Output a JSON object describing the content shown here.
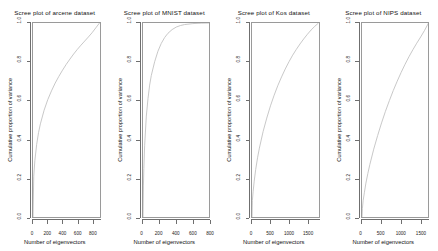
{
  "figure": {
    "background": "#ffffff",
    "curve_color": "#c2c2c2",
    "axis_color": "#6f6f6f",
    "box_color": "#9a9a9a"
  },
  "chart_data": [
    {
      "type": "line",
      "title": "Scree plot of arcene dataset",
      "xlabel": "Number of eigenvectors",
      "ylabel": "Cumulative proportion of variance",
      "xlim": [
        0,
        900
      ],
      "ylim": [
        0,
        1.0
      ],
      "xticks": [
        0,
        200,
        400,
        600,
        800
      ],
      "xticklabels": [
        "0",
        "200",
        "400",
        "600",
        "800"
      ],
      "yticks": [
        0.0,
        0.2,
        0.4,
        0.6,
        0.8,
        1.0
      ],
      "yticklabels": [
        "0.0",
        "0.2",
        "0.4",
        "0.6",
        "0.8",
        "1.0"
      ],
      "grid": false,
      "legend": "none",
      "series": [
        {
          "name": "cumulative proportion of variance",
          "x": [
            0,
            10,
            25,
            50,
            75,
            100,
            150,
            200,
            250,
            300,
            350,
            400,
            450,
            500,
            550,
            600,
            650,
            700,
            750,
            800,
            850,
            900
          ],
          "y": [
            0.0,
            0.21,
            0.29,
            0.375,
            0.435,
            0.48,
            0.55,
            0.605,
            0.65,
            0.69,
            0.725,
            0.757,
            0.787,
            0.814,
            0.84,
            0.864,
            0.886,
            0.907,
            0.928,
            0.95,
            0.975,
            1.0
          ]
        }
      ]
    },
    {
      "type": "line",
      "title": "Scree plot of MNIST dataset",
      "xlabel": "Number of eigenvectors",
      "ylabel": "Cumulative proportion of variance",
      "xlim": [
        0,
        800
      ],
      "ylim": [
        0,
        1.0
      ],
      "xticks": [
        0,
        200,
        400,
        600,
        800
      ],
      "xticklabels": [
        "0",
        "200",
        "400",
        "600",
        "800"
      ],
      "yticks": [
        0.0,
        0.2,
        0.4,
        0.6,
        0.8,
        1.0
      ],
      "yticklabels": [
        "0.0",
        "0.2",
        "0.4",
        "0.6",
        "0.8",
        "1.0"
      ],
      "grid": false,
      "legend": "none",
      "series": [
        {
          "name": "cumulative proportion of variance",
          "x": [
            0,
            5,
            10,
            20,
            40,
            60,
            80,
            100,
            140,
            180,
            220,
            260,
            300,
            350,
            400,
            450,
            500,
            600,
            700,
            800
          ],
          "y": [
            0.0,
            0.16,
            0.25,
            0.37,
            0.52,
            0.61,
            0.68,
            0.73,
            0.8,
            0.855,
            0.895,
            0.925,
            0.947,
            0.966,
            0.979,
            0.987,
            0.992,
            0.997,
            0.999,
            1.0
          ]
        }
      ]
    },
    {
      "type": "line",
      "title": "Scree plot of Kos dataset",
      "xlabel": "Number of eigenvectors",
      "ylabel": "Cumulative proportion of variance",
      "xlim": [
        0,
        1800
      ],
      "ylim": [
        0,
        1.0
      ],
      "xticks": [
        0,
        500,
        1000,
        1500
      ],
      "xticklabels": [
        "0",
        "500",
        "1000",
        "1500"
      ],
      "yticks": [
        0.0,
        0.2,
        0.4,
        0.6,
        0.8,
        1.0
      ],
      "yticklabels": [
        "0.0",
        "0.2",
        "0.4",
        "0.6",
        "0.8",
        "1.0"
      ],
      "grid": false,
      "legend": "none",
      "series": [
        {
          "name": "cumulative proportion of variance",
          "x": [
            0,
            10,
            30,
            60,
            100,
            150,
            200,
            300,
            400,
            500,
            600,
            700,
            800,
            900,
            1000,
            1100,
            1200,
            1300,
            1400,
            1500,
            1600,
            1700,
            1800
          ],
          "y": [
            0.0,
            0.085,
            0.13,
            0.185,
            0.245,
            0.305,
            0.355,
            0.44,
            0.51,
            0.573,
            0.628,
            0.678,
            0.722,
            0.763,
            0.8,
            0.834,
            0.864,
            0.892,
            0.918,
            0.942,
            0.964,
            0.983,
            1.0
          ]
        }
      ]
    },
    {
      "type": "line",
      "title": "Scree plot of NIPS dataset",
      "xlabel": "Number of eigenvectors",
      "ylabel": "Cumulative proportion of variance",
      "xlim": [
        0,
        1700
      ],
      "ylim": [
        0,
        1.0
      ],
      "xticks": [
        0,
        500,
        1000,
        1500
      ],
      "xticklabels": [
        "0",
        "500",
        "1000",
        "1500"
      ],
      "yticks": [
        0.0,
        0.2,
        0.4,
        0.6,
        0.8,
        1.0
      ],
      "yticklabels": [
        "0.0",
        "0.2",
        "0.4",
        "0.6",
        "0.8",
        "1.0"
      ],
      "grid": false,
      "legend": "none",
      "series": [
        {
          "name": "cumulative proportion of variance",
          "x": [
            0,
            10,
            30,
            60,
            100,
            150,
            200,
            300,
            400,
            500,
            600,
            700,
            800,
            900,
            1000,
            1100,
            1200,
            1300,
            1400,
            1500,
            1600,
            1700
          ],
          "y": [
            0.0,
            0.045,
            0.085,
            0.125,
            0.175,
            0.225,
            0.27,
            0.35,
            0.42,
            0.485,
            0.545,
            0.6,
            0.652,
            0.7,
            0.745,
            0.787,
            0.826,
            0.862,
            0.896,
            0.928,
            0.962,
            1.0
          ]
        }
      ]
    }
  ]
}
